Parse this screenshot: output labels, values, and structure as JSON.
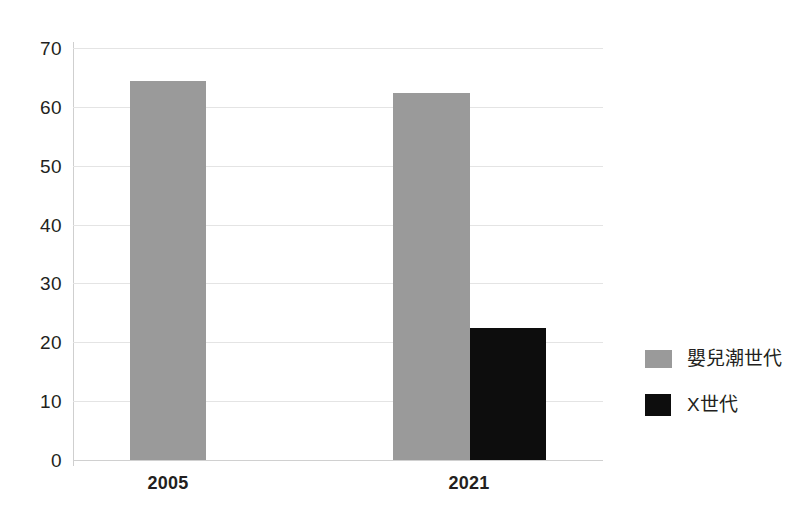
{
  "chart_data": {
    "type": "bar",
    "title": "",
    "subtitle": "",
    "xlabel": "",
    "ylabel": "",
    "categories": [
      "2005",
      "2021"
    ],
    "series": [
      {
        "name": "嬰兒潮世代",
        "color": "#9a9a9a",
        "values": [
          64.4,
          62.3
        ]
      },
      {
        "name": "X世代",
        "color": "#0d0d0d",
        "values": [
          null,
          22.5
        ]
      }
    ],
    "ylim": [
      0,
      70
    ],
    "ytick_labels": [
      "0",
      "10",
      "20",
      "30",
      "40",
      "50",
      "60",
      "70"
    ],
    "ytick_values": [
      0,
      10,
      20,
      30,
      40,
      50,
      60,
      70
    ],
    "grid": true,
    "grid_axis": "y",
    "legend": {
      "position": "right",
      "entries": [
        {
          "label": "嬰兒潮世代",
          "swatch": "#9a9a9a"
        },
        {
          "label": "X世代",
          "swatch": "#111111"
        }
      ]
    },
    "gridline_color": "#e4e4e4",
    "axis_color": "#cfcfcf",
    "background": "#ffffff"
  }
}
